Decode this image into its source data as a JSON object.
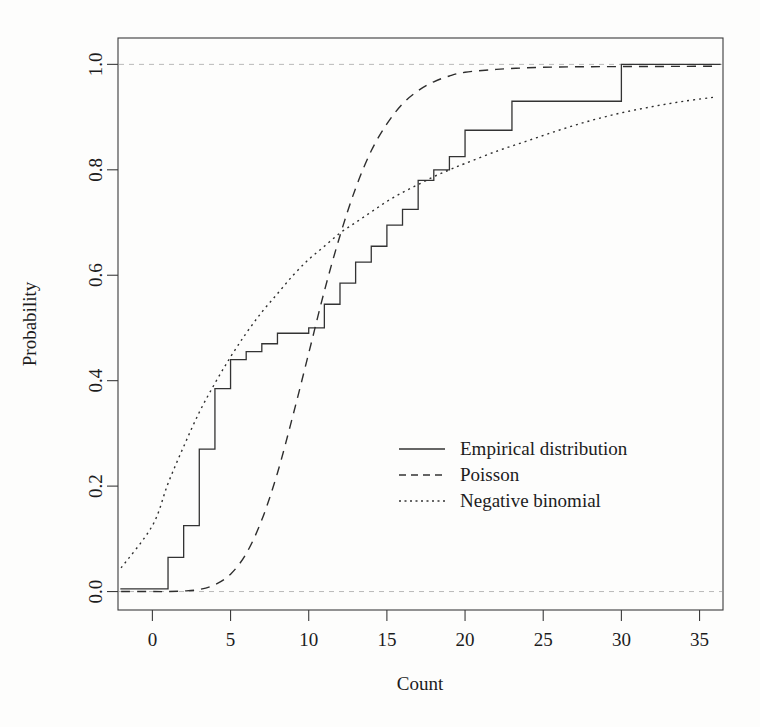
{
  "chart_data": {
    "type": "line",
    "title": "",
    "xlabel": "Count",
    "ylabel": "Probability",
    "xlim": [
      -2.2,
      36.5
    ],
    "ylim": [
      -0.035,
      1.05
    ],
    "grid": false,
    "legend_position": "center-right",
    "xticks": [
      0,
      5,
      10,
      15,
      20,
      25,
      30,
      35
    ],
    "xtick_labels": [
      "0",
      "5",
      "10",
      "15",
      "20",
      "25",
      "30",
      "35"
    ],
    "yticks": [
      0.0,
      0.2,
      0.4,
      0.6,
      0.8,
      1.0
    ],
    "ytick_labels": [
      "0.0",
      "0.2",
      "0.4",
      "0.6",
      "0.8",
      "1.0"
    ],
    "reference_lines": [
      {
        "name": "y-zero",
        "y": 0.0,
        "style": "dashed",
        "color": "#b9b9b9"
      },
      {
        "name": "y-one",
        "y": 1.0,
        "style": "dashed",
        "color": "#b9b9b9"
      }
    ],
    "series": [
      {
        "name": "Empirical distribution",
        "style": "solid",
        "color": "#333333",
        "kind": "step-ecdf",
        "x": [
          0,
          1,
          2,
          3,
          4,
          5,
          6,
          7,
          8,
          9,
          10,
          11,
          12,
          13,
          14,
          15,
          16,
          17,
          18,
          19,
          20,
          23,
          30
        ],
        "y": [
          0.005,
          0.065,
          0.125,
          0.27,
          0.385,
          0.44,
          0.455,
          0.47,
          0.49,
          0.49,
          0.5,
          0.545,
          0.585,
          0.625,
          0.655,
          0.695,
          0.725,
          0.78,
          0.8,
          0.825,
          0.875,
          0.93,
          1.0
        ]
      },
      {
        "name": "Poisson",
        "style": "dashed",
        "color": "#2e2e2e",
        "kind": "smooth-cdf",
        "x": [
          -2,
          0,
          1,
          2,
          3,
          4,
          5,
          6,
          7,
          8,
          9,
          10,
          11,
          12,
          13,
          14,
          15,
          16,
          17,
          18,
          19,
          20,
          22,
          24,
          26,
          28,
          30,
          32,
          34,
          36
        ],
        "y": [
          0.0,
          0.0,
          0.0,
          0.001,
          0.004,
          0.013,
          0.033,
          0.072,
          0.136,
          0.225,
          0.335,
          0.452,
          0.57,
          0.675,
          0.765,
          0.836,
          0.887,
          0.925,
          0.95,
          0.967,
          0.978,
          0.985,
          0.9905,
          0.9935,
          0.995,
          0.9955,
          0.9958,
          0.996,
          0.9962,
          0.9965
        ]
      },
      {
        "name": "Negative binomial",
        "style": "dotted",
        "color": "#2e2e2e",
        "kind": "smooth-cdf",
        "x": [
          -2,
          0,
          1,
          2,
          3,
          4,
          5,
          6,
          7,
          8,
          9,
          10,
          11,
          12,
          13,
          14,
          15,
          16,
          17,
          18,
          19,
          20,
          22,
          24,
          26,
          28,
          30,
          32,
          34,
          36
        ],
        "y": [
          0.045,
          0.125,
          0.205,
          0.275,
          0.34,
          0.395,
          0.445,
          0.49,
          0.53,
          0.565,
          0.6,
          0.63,
          0.655,
          0.68,
          0.7,
          0.72,
          0.74,
          0.757,
          0.772,
          0.787,
          0.8,
          0.812,
          0.835,
          0.855,
          0.875,
          0.893,
          0.908,
          0.92,
          0.93,
          0.938
        ]
      }
    ],
    "legend": [
      {
        "label": "Empirical distribution",
        "style": "solid"
      },
      {
        "label": "Poisson",
        "style": "dashed"
      },
      {
        "label": "Negative binomial",
        "style": "dotted"
      }
    ]
  }
}
